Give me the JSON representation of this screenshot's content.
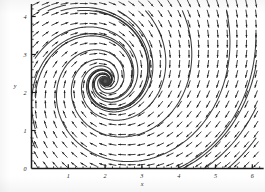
{
  "figure": {
    "kind": "vector-field-phase-portrait",
    "background_color": "#ffffff",
    "ink_color": "#1d1d1d",
    "stream_color": "#2a2a2a"
  },
  "chart_data": {
    "type": "scatter",
    "title": "",
    "subtitle": "",
    "xlabel": "x",
    "ylabel": "y",
    "xlim": [
      0,
      6.2
    ],
    "ylim": [
      0,
      4.25
    ],
    "xticks": [
      0,
      1,
      2,
      3,
      4,
      5,
      6
    ],
    "xticklabels": [
      "0",
      "1",
      "2",
      "3",
      "4",
      "5",
      "6"
    ],
    "yticks": [
      0,
      1,
      2,
      3,
      4
    ],
    "yticklabels": [
      "0",
      "1",
      "2",
      "3",
      "4"
    ],
    "minor_tick_step": 0.2,
    "grid": false,
    "legend": false,
    "legend_position": "none",
    "plot_kind": "direction field with streamlines (phase portrait)",
    "equilibrium": {
      "label": "stable spiral focus",
      "x": 2.0,
      "y": 2.3,
      "spiral_direction": "clockwise"
    },
    "field_model": {
      "description": "planar autonomous system whose orbits spiral clockwise into the focus at (2, 2.3); arrows scaled to unit length",
      "u": "(y - 2.3) - 0.30*(x - 2.0)",
      "v": "-(x - 2.0) - 0.30*(y - 2.3)"
    },
    "arrow_grid": {
      "x_start": 0.12,
      "x_step": 0.26,
      "x_count": 24,
      "y_start": 0.1,
      "y_step": 0.265,
      "y_count": 17,
      "arrow_length_px": 7.2,
      "head_length_px": 2.6
    },
    "streamlines_seeds": [
      {
        "x": 0.18,
        "y": 4.15
      },
      {
        "x": 0.45,
        "y": 4.15
      },
      {
        "x": 0.8,
        "y": 4.15
      },
      {
        "x": 1.25,
        "y": 4.15
      },
      {
        "x": 1.75,
        "y": 4.15
      },
      {
        "x": 2.35,
        "y": 4.15
      },
      {
        "x": 3.1,
        "y": 4.15
      },
      {
        "x": 4.1,
        "y": 4.15
      },
      {
        "x": 5.3,
        "y": 4.15
      },
      {
        "x": 6.1,
        "y": 3.55
      },
      {
        "x": 6.1,
        "y": 2.7
      },
      {
        "x": 6.1,
        "y": 1.6
      },
      {
        "x": 6.1,
        "y": 0.8
      },
      {
        "x": 0.1,
        "y": 2.9
      },
      {
        "x": 0.1,
        "y": 1.9
      },
      {
        "x": 0.1,
        "y": 1.05
      },
      {
        "x": 0.1,
        "y": 0.55
      }
    ]
  },
  "axes": {
    "x_axis_label": "x",
    "y_axis_label": "y",
    "origin_label": "0"
  }
}
